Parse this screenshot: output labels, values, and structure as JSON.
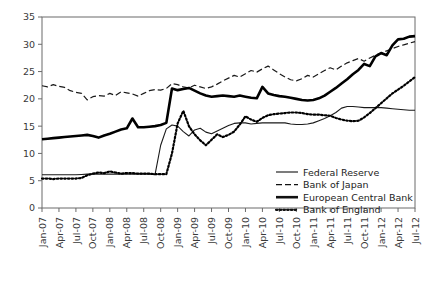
{
  "chart_data": {
    "type": "line",
    "title": "",
    "subtitle": "",
    "xlabel": "",
    "ylabel": "",
    "ylim": [
      0,
      35
    ],
    "yticks": [
      0,
      5,
      10,
      15,
      20,
      25,
      30,
      35
    ],
    "grid": false,
    "legend_position": "inside-bottom-right",
    "x_tick_labels": [
      "Jan-07",
      "Apr-07",
      "Jul-07",
      "Oct-07",
      "Jan-08",
      "Apr-08",
      "Jul-08",
      "Oct-08",
      "Jan-09",
      "Apr-09",
      "Jul-09",
      "Oct-09",
      "Jan-10",
      "Apr-10",
      "Jul-10",
      "Oct-10",
      "Jan-11",
      "Apr-11",
      "Jul-11",
      "Oct-11",
      "Jan-12",
      "Apr-12",
      "Jul-12"
    ],
    "x_first": "Jan-07",
    "x_last": "Jul-12",
    "x_n_points": 67,
    "series": [
      {
        "name": "Federal Reserve",
        "style": "solid-thin",
        "color": "#1a1a1a",
        "values": [
          6.1,
          6.1,
          6.1,
          6.1,
          6.1,
          6.1,
          6.1,
          6.15,
          6.2,
          6.2,
          6.2,
          6.2,
          6.2,
          6.2,
          6.2,
          6.2,
          6.2,
          6.2,
          6.2,
          6.2,
          6.1,
          11.5,
          14.5,
          15.2,
          15.0,
          14.0,
          13.2,
          14.3,
          14.6,
          13.9,
          13.6,
          14.1,
          14.6,
          15.1,
          15.5,
          15.6,
          15.6,
          15.4,
          15.5,
          15.6,
          15.6,
          15.6,
          15.6,
          15.6,
          15.4,
          15.3,
          15.3,
          15.4,
          15.6,
          16.0,
          16.4,
          16.9,
          17.5,
          18.3,
          18.6,
          18.6,
          18.5,
          18.4,
          18.4,
          18.4,
          18.4,
          18.3,
          18.2,
          18.1,
          18.0,
          17.9,
          17.9
        ]
      },
      {
        "name": "Bank of Japan",
        "style": "dashed",
        "color": "#1a1a1a",
        "values": [
          22.4,
          22.2,
          22.6,
          22.3,
          22.1,
          21.5,
          21.2,
          21.0,
          19.8,
          20.4,
          20.6,
          20.5,
          21.0,
          20.6,
          21.3,
          21.1,
          20.9,
          20.5,
          21.0,
          21.5,
          21.7,
          21.6,
          21.9,
          22.8,
          22.6,
          22.2,
          22.0,
          22.5,
          22.2,
          21.9,
          22.2,
          22.7,
          23.3,
          23.8,
          24.3,
          24.0,
          24.6,
          25.2,
          24.9,
          25.5,
          26.0,
          25.3,
          24.6,
          24.0,
          23.5,
          23.3,
          23.7,
          24.3,
          24.0,
          24.6,
          25.2,
          25.7,
          25.3,
          26.0,
          26.6,
          27.0,
          27.4,
          26.9,
          27.5,
          28.0,
          28.4,
          28.8,
          29.2,
          29.6,
          29.9,
          30.2,
          30.5
        ]
      },
      {
        "name": "European Central Bank",
        "style": "solid-thick",
        "color": "#000000",
        "values": [
          12.6,
          12.7,
          12.8,
          12.9,
          13.0,
          13.1,
          13.2,
          13.3,
          13.4,
          13.2,
          12.9,
          13.3,
          13.6,
          14.0,
          14.4,
          14.6,
          16.4,
          14.8,
          14.8,
          14.9,
          15.0,
          15.2,
          15.6,
          21.9,
          21.6,
          21.8,
          22.0,
          21.5,
          21.0,
          20.6,
          20.4,
          20.5,
          20.6,
          20.5,
          20.4,
          20.6,
          20.4,
          20.2,
          20.1,
          22.2,
          21.0,
          20.7,
          20.5,
          20.4,
          20.2,
          20.0,
          19.8,
          19.7,
          19.8,
          20.1,
          20.6,
          21.3,
          22.0,
          22.8,
          23.6,
          24.5,
          25.3,
          26.4,
          26.0,
          27.8,
          28.4,
          28.0,
          29.8,
          30.9,
          31.0,
          31.4,
          31.5
        ]
      },
      {
        "name": "Bank of England",
        "style": "dotted",
        "color": "#000000",
        "values": [
          5.4,
          5.4,
          5.3,
          5.4,
          5.4,
          5.4,
          5.4,
          5.5,
          6.0,
          6.3,
          6.5,
          6.4,
          6.7,
          6.5,
          6.3,
          6.4,
          6.4,
          6.3,
          6.3,
          6.3,
          6.2,
          6.2,
          6.2,
          10.0,
          15.5,
          17.8,
          15.0,
          13.5,
          12.4,
          11.5,
          12.5,
          13.5,
          13.0,
          13.4,
          14.0,
          15.3,
          16.8,
          16.2,
          15.8,
          16.5,
          17.0,
          17.2,
          17.3,
          17.4,
          17.5,
          17.5,
          17.4,
          17.2,
          17.1,
          17.1,
          17.0,
          16.9,
          16.5,
          16.2,
          16.0,
          15.9,
          16.0,
          16.6,
          17.4,
          18.3,
          19.2,
          20.1,
          21.0,
          21.7,
          22.4,
          23.2,
          24.0
        ]
      }
    ]
  },
  "legend": {
    "items": [
      {
        "label": "Federal Reserve",
        "style": "solid-thin"
      },
      {
        "label": "Bank of Japan",
        "style": "dashed"
      },
      {
        "label": "European Central Bank",
        "style": "solid-thick"
      },
      {
        "label": "Bank of England",
        "style": "dotted"
      }
    ]
  },
  "axis": {
    "y_tick_labels": [
      "0",
      "5",
      "10",
      "15",
      "20",
      "25",
      "30",
      "35"
    ]
  }
}
